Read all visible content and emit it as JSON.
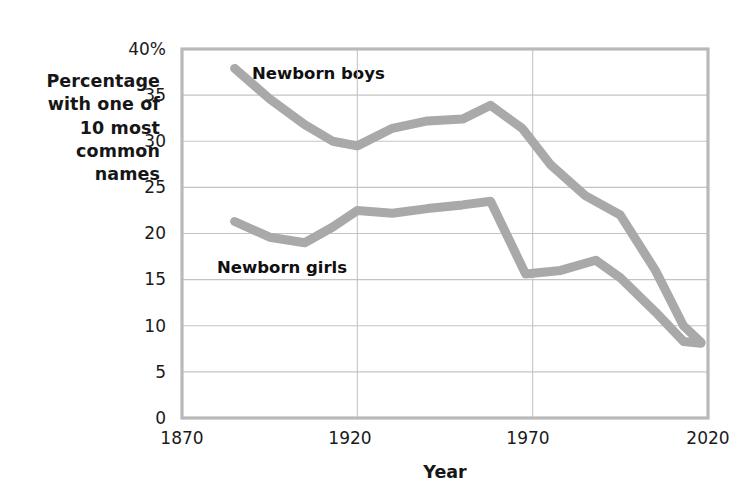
{
  "chart_data": {
    "type": "line",
    "title": "",
    "xlabel": "Year",
    "ylabel": "Percentage with one of 10 most common names",
    "ylabel_lines": [
      "Percentage",
      "with one of",
      "10 most",
      "common",
      "names"
    ],
    "xlim": [
      1870,
      2020
    ],
    "ylim": [
      0,
      40
    ],
    "xticks": [
      1870,
      1920,
      1970,
      2020
    ],
    "xticklabels": [
      "1870",
      "1920",
      "1970",
      "2020"
    ],
    "yticks": [
      0,
      5,
      10,
      15,
      20,
      25,
      30,
      35,
      40
    ],
    "yticklabels": [
      "0",
      "5",
      "10",
      "15",
      "20",
      "25",
      "30",
      "35",
      "40%"
    ],
    "grid": true,
    "grid_axis": "both",
    "legend_position": "inline-annotation",
    "series": [
      {
        "name": "Newborn boys",
        "color": "#a9a9a9",
        "x": [
          1885,
          1895,
          1905,
          1913,
          1920,
          1930,
          1940,
          1950,
          1958,
          1967,
          1975,
          1985,
          1995,
          2005,
          2013,
          2018
        ],
        "values": [
          37.9,
          34.6,
          31.8,
          30.0,
          29.5,
          31.4,
          32.2,
          32.4,
          33.9,
          31.4,
          27.5,
          24.1,
          22.0,
          16.0,
          10.0,
          8.2
        ]
      },
      {
        "name": "Newborn girls",
        "color": "#a9a9a9",
        "x": [
          1885,
          1895,
          1905,
          1913,
          1920,
          1930,
          1940,
          1950,
          1958,
          1968,
          1978,
          1988,
          1995,
          2005,
          2013,
          2018
        ],
        "values": [
          21.3,
          19.6,
          19.0,
          20.7,
          22.5,
          22.2,
          22.7,
          23.1,
          23.5,
          15.6,
          16.0,
          17.1,
          15.2,
          11.5,
          8.3,
          8.1
        ]
      }
    ],
    "annotations": [
      {
        "text": "Newborn boys",
        "x": 1910,
        "y": 37.0
      },
      {
        "text": "Newborn girls",
        "x": 1897,
        "y": 16.6
      }
    ]
  },
  "axis": {
    "y_title_lines": [
      "Percentage",
      "with one of",
      "10 most",
      "common",
      "names"
    ],
    "x_title": "Year"
  }
}
